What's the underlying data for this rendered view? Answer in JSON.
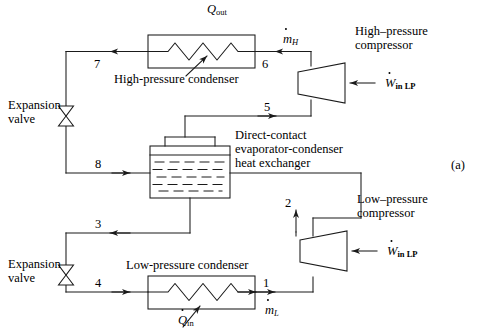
{
  "figure": {
    "panel_tag": "(a)",
    "type": "process-flow-diagram",
    "title_implied": "Cascade refrigeration cycle with direct-contact evaporator-condenser"
  },
  "components": {
    "high_pressure_condenser": {
      "label": "High-pressure condenser",
      "heat_symbol": "Q",
      "heat_subscript": "out",
      "heat_direction": "out"
    },
    "low_pressure_condenser": {
      "label": "Low-pressure condenser",
      "heat_symbol": "Q",
      "heat_subscript": "in",
      "heat_direction": "in"
    },
    "heat_exchanger": {
      "label_line1": "Direct-contact",
      "label_line2": "evaporator-condenser",
      "label_line3": "heat exchanger"
    },
    "high_pressure_compressor": {
      "label_line1": "High–pressure",
      "label_line2": "compressor",
      "work_symbol": "W",
      "work_subscript": "in LP"
    },
    "low_pressure_compressor": {
      "label_line1": "Low–pressure",
      "label_line2": "compressor",
      "work_symbol": "W",
      "work_subscript": "in LP"
    },
    "expansion_valve_upper": {
      "label_line1": "Expansion",
      "label_line2": "valve"
    },
    "expansion_valve_lower": {
      "label_line1": "Expansion",
      "label_line2": "valve"
    }
  },
  "mass_flows": {
    "high": {
      "symbol": "m",
      "subscript": "H"
    },
    "low": {
      "symbol": "m",
      "subscript": "L"
    }
  },
  "state_points": [
    {
      "id": "1",
      "label": "1"
    },
    {
      "id": "2",
      "label": "2"
    },
    {
      "id": "3",
      "label": "3"
    },
    {
      "id": "4",
      "label": "4"
    },
    {
      "id": "5",
      "label": "5"
    },
    {
      "id": "6",
      "label": "6"
    },
    {
      "id": "7",
      "label": "7"
    },
    {
      "id": "8",
      "label": "8"
    }
  ],
  "colors": {
    "line": "#1a1a1a",
    "background": "#ffffff",
    "text": "#000000"
  }
}
